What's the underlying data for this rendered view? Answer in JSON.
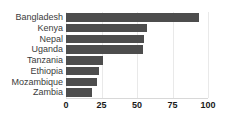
{
  "chart_data": {
    "type": "bar",
    "orientation": "horizontal",
    "title": "",
    "subtitle": "",
    "xlabel": "",
    "ylabel": "",
    "categories": [
      "Bangladesh",
      "Kenya",
      "Nepal",
      "Uganda",
      "Tanzania",
      "Ethiopia",
      "Mozambique",
      "Zambia"
    ],
    "values": [
      94,
      57,
      55,
      54,
      26,
      23,
      22,
      18
    ],
    "xlim": [
      0,
      100
    ],
    "xticks": [
      0,
      25,
      50,
      75,
      100
    ],
    "xtick_labels": [
      "0",
      "25",
      "50",
      "75",
      "100"
    ],
    "grid": true,
    "grid_axis": "x",
    "legend": false,
    "bar_color": "#4d4d4d",
    "gridline_color": "#e9e9e9",
    "axis_color": "#d8d8d8",
    "label_color": "#3b3b3b",
    "tick_label_color": "#1a1a1a",
    "background": "#ffffff"
  }
}
